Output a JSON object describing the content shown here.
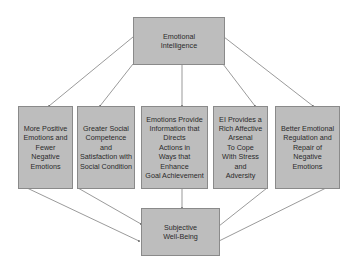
{
  "diagram": {
    "colors": {
      "box_fill": "#bdbdbd",
      "box_border": "#8a8a8a",
      "line": "#6e6e6e",
      "text": "#2a2a2a"
    },
    "nodes": {
      "top": {
        "label": "Emotional\nIntelligence"
      },
      "m1": {
        "label": "More Positive\nEmotions and\nFewer Negative\nEmotions"
      },
      "m2": {
        "label": "Greater  Social\nCompetence\nand\nSatisfaction with\nSocial Condition"
      },
      "m3": {
        "label": "Emotions Provide\nInformation that\nDirects\nActions in\nWays that\nEnhance\nGoal Achievement"
      },
      "m4": {
        "label": "EI  Provides a\nRich Affective\nArsenal\nTo Cope\nWith Stress\nand\nAdversity"
      },
      "m5": {
        "label": "Better Emotional\nRegulation and\nRepair of\nNegative\nEmotions"
      },
      "bottom": {
        "label": "Subjective\nWell-Being"
      }
    },
    "edges": [
      {
        "from": "top",
        "to": "m1"
      },
      {
        "from": "top",
        "to": "m2"
      },
      {
        "from": "top",
        "to": "m3"
      },
      {
        "from": "top",
        "to": "m4"
      },
      {
        "from": "top",
        "to": "m5"
      },
      {
        "from": "m1",
        "to": "bottom"
      },
      {
        "from": "m2",
        "to": "bottom"
      },
      {
        "from": "m3",
        "to": "bottom"
      },
      {
        "from": "m4",
        "to": "bottom"
      },
      {
        "from": "m5",
        "to": "bottom"
      }
    ]
  }
}
